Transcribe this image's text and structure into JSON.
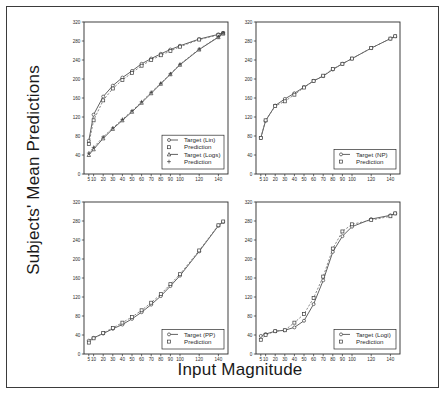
{
  "figure": {
    "y_axis_title": "Subjects' Mean Predictions",
    "x_axis_title": "Input Magnitude"
  },
  "chart_data": [
    {
      "type": "line",
      "panel": "top-left",
      "title": "",
      "xlabel": "Input Magnitude",
      "ylabel": "Subjects' Mean Predictions",
      "xlim": [
        0,
        150
      ],
      "ylim": [
        0,
        320
      ],
      "xticks": [
        5,
        10,
        20,
        30,
        40,
        50,
        60,
        70,
        80,
        90,
        100,
        120,
        140
      ],
      "yticks": [
        0,
        40,
        80,
        120,
        160,
        200,
        240,
        280,
        320
      ],
      "grid": false,
      "legend_position": "lower-right",
      "x": [
        5,
        10,
        20,
        30,
        40,
        50,
        60,
        70,
        80,
        90,
        100,
        120,
        140,
        145
      ],
      "series": [
        {
          "name": "Target (Lin)",
          "marker": "circle",
          "linestyle": "solid",
          "values": [
            70,
            125,
            163,
            186,
            203,
            217,
            232,
            243,
            253,
            262,
            270,
            284,
            294,
            297
          ]
        },
        {
          "name": "Prediction",
          "marker": "square",
          "linestyle": "dashed",
          "values": [
            63,
            113,
            155,
            180,
            198,
            213,
            228,
            240,
            250,
            259,
            268,
            283,
            293,
            296
          ]
        },
        {
          "name": "Target (Logs)",
          "marker": "triangle",
          "linestyle": "solid",
          "values": [
            40,
            52,
            75,
            95,
            113,
            131,
            150,
            170,
            190,
            210,
            230,
            262,
            288,
            296
          ]
        },
        {
          "name": "Prediction",
          "marker": "plus",
          "linestyle": "dashed",
          "values": [
            44,
            56,
            78,
            97,
            115,
            133,
            152,
            172,
            191,
            211,
            231,
            263,
            289,
            297
          ]
        }
      ]
    },
    {
      "type": "line",
      "panel": "top-right",
      "title": "",
      "xlabel": "Input Magnitude",
      "ylabel": "Subjects' Mean Predictions",
      "xlim": [
        0,
        150
      ],
      "ylim": [
        0,
        320
      ],
      "xticks": [
        5,
        10,
        20,
        30,
        40,
        50,
        60,
        70,
        80,
        90,
        100,
        120,
        140
      ],
      "yticks": [
        0,
        40,
        80,
        120,
        160,
        200,
        240,
        280,
        320
      ],
      "grid": false,
      "legend_position": "lower-right",
      "x": [
        5,
        10,
        20,
        30,
        40,
        50,
        60,
        70,
        80,
        90,
        100,
        120,
        140,
        145
      ],
      "series": [
        {
          "name": "Target (NP)",
          "marker": "circle",
          "linestyle": "solid",
          "values": [
            76,
            112,
            144,
            158,
            170,
            183,
            196,
            206,
            220,
            232,
            243,
            265,
            285,
            290
          ]
        },
        {
          "name": "Prediction",
          "marker": "square",
          "linestyle": "dashed",
          "values": [
            76,
            113,
            143,
            153,
            167,
            182,
            196,
            207,
            221,
            232,
            243,
            265,
            285,
            290
          ]
        }
      ]
    },
    {
      "type": "line",
      "panel": "bottom-left",
      "title": "",
      "xlabel": "Input Magnitude",
      "ylabel": "Subjects' Mean Predictions",
      "xlim": [
        0,
        150
      ],
      "ylim": [
        0,
        320
      ],
      "xticks": [
        5,
        10,
        20,
        30,
        40,
        50,
        60,
        70,
        80,
        90,
        100,
        120,
        140
      ],
      "yticks": [
        0,
        40,
        80,
        120,
        160,
        200,
        240,
        280,
        320
      ],
      "grid": false,
      "legend_position": "lower-right",
      "x": [
        5,
        10,
        20,
        30,
        40,
        50,
        60,
        70,
        80,
        90,
        100,
        120,
        140,
        145
      ],
      "series": [
        {
          "name": "Target (PP)",
          "marker": "circle",
          "linestyle": "solid",
          "values": [
            28,
            34,
            43,
            53,
            62,
            74,
            88,
            104,
            122,
            143,
            165,
            216,
            270,
            278
          ]
        },
        {
          "name": "Prediction",
          "marker": "square",
          "linestyle": "dashed",
          "values": [
            24,
            33,
            44,
            55,
            66,
            78,
            92,
            108,
            126,
            147,
            168,
            218,
            271,
            279
          ]
        }
      ]
    },
    {
      "type": "line",
      "panel": "bottom-right",
      "title": "",
      "xlabel": "Input Magnitude",
      "ylabel": "Subjects' Mean Predictions",
      "xlim": [
        0,
        150
      ],
      "ylim": [
        0,
        320
      ],
      "xticks": [
        5,
        10,
        20,
        30,
        40,
        50,
        60,
        70,
        80,
        90,
        100,
        120,
        140
      ],
      "yticks": [
        0,
        40,
        80,
        120,
        160,
        200,
        240,
        280,
        320
      ],
      "grid": false,
      "legend_position": "lower-right",
      "x": [
        5,
        10,
        20,
        30,
        40,
        50,
        60,
        70,
        80,
        90,
        100,
        120,
        140,
        145
      ],
      "series": [
        {
          "name": "Target (Logi)",
          "marker": "circle",
          "linestyle": "solid",
          "values": [
            38,
            42,
            48,
            50,
            56,
            70,
            105,
            155,
            215,
            248,
            268,
            284,
            292,
            296
          ]
        },
        {
          "name": "Prediction",
          "marker": "square",
          "linestyle": "dashed",
          "values": [
            30,
            40,
            48,
            50,
            66,
            84,
            118,
            163,
            222,
            258,
            273,
            282,
            290,
            296
          ]
        }
      ]
    }
  ]
}
